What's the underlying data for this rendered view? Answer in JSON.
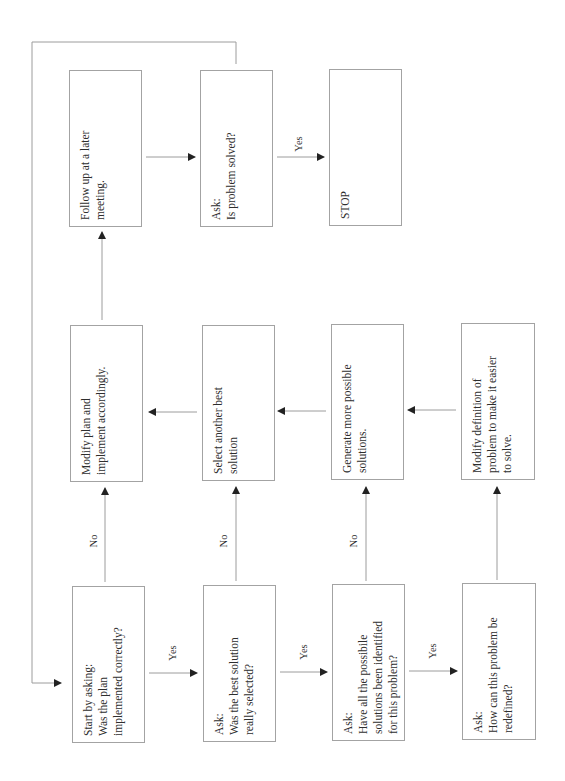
{
  "diagram": {
    "type": "flowchart",
    "orientation": "rotated-90-ccw",
    "colors": {
      "line": "#9c9c9c",
      "arrowhead": "#222222",
      "text": "#2e2e2e",
      "border": "#a3a3a3"
    },
    "nodes": [
      {
        "id": "follow_up",
        "text": "Follow up at a later\nmeeting."
      },
      {
        "id": "ask_solved",
        "text": "Ask:\nIs problem solved?"
      },
      {
        "id": "stop",
        "text": "STOP"
      },
      {
        "id": "modify_plan",
        "text": "Modify plan and\nimplement accordingly."
      },
      {
        "id": "select_another",
        "text": "Select another best\nsolution"
      },
      {
        "id": "generate_more",
        "text": "Generate more possible\nsolutions."
      },
      {
        "id": "modify_definition",
        "text": "Modify definition of\nproblem to make it easier\nto solve."
      },
      {
        "id": "start",
        "text": "Start by asking:\nWas the plan\nimplemented correctly?"
      },
      {
        "id": "ask_best",
        "text": "Ask:\nWas the best solution\nreally selected?"
      },
      {
        "id": "ask_all",
        "text": "Ask:\nHave all the possibile\nsolutions been identified\nfor this problem?"
      },
      {
        "id": "ask_redefine",
        "text": "Ask:\nHow can this problem be\nredefined?"
      }
    ],
    "edge_labels": {
      "yes": "Yes",
      "no": "No"
    },
    "edges": [
      {
        "from": "start",
        "to": "ask_best",
        "label": "Yes"
      },
      {
        "from": "ask_best",
        "to": "ask_all",
        "label": "Yes"
      },
      {
        "from": "ask_all",
        "to": "ask_redefine",
        "label": "Yes"
      },
      {
        "from": "start",
        "to": "modify_plan",
        "label": "No"
      },
      {
        "from": "ask_best",
        "to": "select_another",
        "label": "No"
      },
      {
        "from": "ask_all",
        "to": "generate_more",
        "label": "No"
      },
      {
        "from": "ask_redefine",
        "to": "modify_definition",
        "label": ""
      },
      {
        "from": "modify_definition",
        "to": "generate_more",
        "label": ""
      },
      {
        "from": "generate_more",
        "to": "select_another",
        "label": ""
      },
      {
        "from": "select_another",
        "to": "modify_plan",
        "label": ""
      },
      {
        "from": "modify_plan",
        "to": "follow_up",
        "label": ""
      },
      {
        "from": "follow_up",
        "to": "ask_solved",
        "label": ""
      },
      {
        "from": "ask_solved",
        "to": "stop",
        "label": "Yes"
      },
      {
        "from": "ask_solved",
        "to": "start",
        "label": ""
      }
    ]
  }
}
